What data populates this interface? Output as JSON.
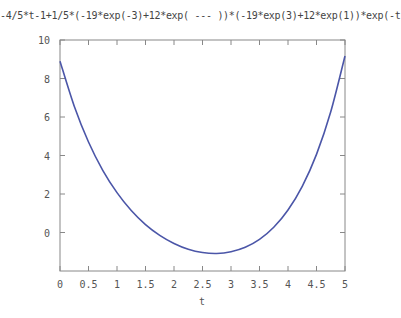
{
  "chart_data": {
    "type": "line",
    "title": "-4/5*t-1+1/5*(-19*exp(-3)+12*exp( --- ))*(-19*exp(3)+12*exp(1))*exp(-t)",
    "xlabel": "t",
    "ylabel": "",
    "xlim": [
      0,
      5
    ],
    "ylim": [
      -2,
      10
    ],
    "xticks": [
      "0",
      "0.5",
      "1",
      "1.5",
      "2",
      "2.5",
      "3",
      "3.5",
      "4",
      "4.5",
      "5"
    ],
    "yticks": [
      "0",
      "2",
      "4",
      "6",
      "8",
      "10"
    ],
    "grid": false,
    "legend": null,
    "line_color": "#4b56a8",
    "series": [
      {
        "name": "f(t)",
        "x": [
          0,
          0.25,
          0.5,
          0.75,
          1,
          1.25,
          1.5,
          1.75,
          2,
          2.25,
          2.5,
          2.75,
          3,
          3.25,
          3.5,
          3.75,
          4,
          4.25,
          4.5,
          4.75,
          5
        ],
        "values": [
          8.9,
          6.56,
          4.7,
          3.23,
          2.07,
          1.14,
          0.41,
          -0.15,
          -0.57,
          -0.87,
          -1.04,
          -1.09,
          -1.0,
          -0.77,
          -0.36,
          0.27,
          1.17,
          2.4,
          4.06,
          6.27,
          9.17
        ]
      }
    ]
  }
}
